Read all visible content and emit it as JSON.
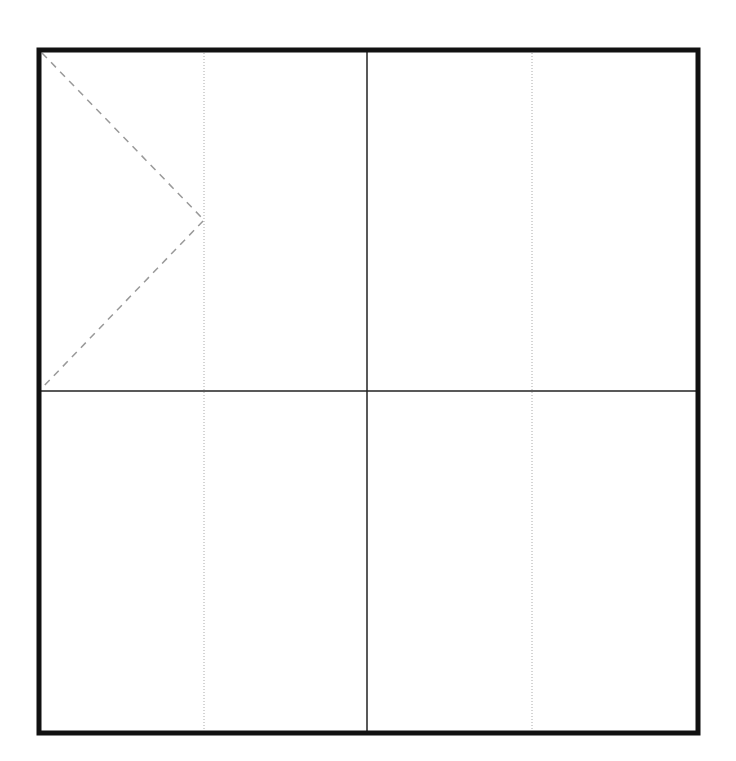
{
  "diagram": {
    "type": "folding-pattern",
    "colors": {
      "background": "#ffffff",
      "border": "#111111",
      "fold_line": "#222222",
      "dotted_line": "#aaaaaa",
      "dashed_line": "#999999"
    },
    "outer_border": {
      "x1": 39,
      "y1": 50,
      "x2": 698,
      "y2": 733,
      "stroke_width": 5
    },
    "solid_lines": [
      {
        "name": "center-vertical",
        "x1": 367,
        "y1": 50,
        "x2": 367,
        "y2": 733
      },
      {
        "name": "center-horizontal",
        "x1": 39,
        "y1": 391,
        "x2": 698,
        "y2": 391
      }
    ],
    "dotted_lines": [
      {
        "name": "left-quarter-vertical",
        "x1": 204,
        "y1": 50,
        "x2": 204,
        "y2": 733
      },
      {
        "name": "right-quarter-vertical",
        "x1": 532,
        "y1": 50,
        "x2": 532,
        "y2": 733
      }
    ],
    "dashed_polyline": {
      "name": "triangle-fold",
      "points": [
        [
          42,
          53
        ],
        [
          204,
          220
        ],
        [
          42,
          388
        ]
      ]
    }
  }
}
